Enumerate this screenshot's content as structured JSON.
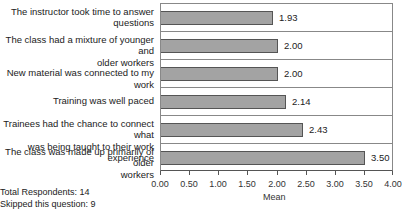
{
  "chart_data": {
    "type": "bar",
    "orientation": "horizontal",
    "categories": [
      "The instructor took time to answer questions",
      "The class had a mixture of younger and older workers",
      "New material was connected to my work",
      "Training was well paced",
      "Trainees had the chance to connect what was being taught to their work experience",
      "The class was made up primarily of older workers"
    ],
    "category_lines": [
      [
        "The instructor took time to answer",
        "questions"
      ],
      [
        "The class had a mixture of younger and",
        "older workers"
      ],
      [
        "New material was connected to my work"
      ],
      [
        "Training was well paced"
      ],
      [
        "Trainees had the chance to connect what",
        "was being taught to their work experience"
      ],
      [
        "The class was made up primarily of older",
        "workers"
      ]
    ],
    "values": [
      1.93,
      2.0,
      2.0,
      2.14,
      2.43,
      3.5
    ],
    "value_labels": [
      "1.93",
      "2.00",
      "2.00",
      "2.14",
      "2.43",
      "3.50"
    ],
    "title": "",
    "xlabel": "Mean",
    "ylabel": "",
    "xlim": [
      0,
      4
    ],
    "x_ticks": [
      "0.00",
      "0.50",
      "1.00",
      "1.50",
      "2.00",
      "2.50",
      "3.00",
      "3.50",
      "4.00"
    ],
    "grid": false,
    "legend": null,
    "bar_color": "#a3a3a3",
    "bar_border_color": "#555555"
  },
  "footer": {
    "total_respondents": "Total Respondents: 14",
    "skipped": "Skipped this question: 9"
  }
}
